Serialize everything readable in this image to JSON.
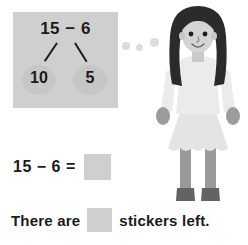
{
  "worksheet": {
    "number_bond": {
      "total_expression": "15 − 6",
      "left_part": "10",
      "right_part": "5",
      "panel_color": "#cfcfcf",
      "circle_color": "#c6c6c6"
    },
    "equation": {
      "text": "15 − 6 =",
      "answer_blank": "",
      "blank_color": "#cfcfcf"
    },
    "sentence": {
      "prefix": "There are",
      "blank": "",
      "suffix": "stickers left."
    },
    "illustration": {
      "subject": "girl-standing",
      "hair_color": "#2b2b2b",
      "skin_color": "#d4d4d4",
      "shirt_color": "#ebebeb",
      "skirt_color": "#e4e4e4",
      "leg_color": "#9a9a9a",
      "shoe_color": "#636363",
      "dots": [
        "dot-1",
        "dot-2",
        "dot-3"
      ],
      "dot_color": "#dcdcdc"
    },
    "text_color": "#1b1b1b"
  }
}
